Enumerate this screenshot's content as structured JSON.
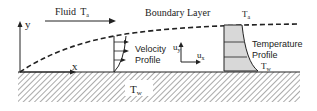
{
  "title": "Boundary Layer",
  "fluid_label": "Fluid",
  "free_stream_temp": {
    "symbol": "T",
    "subscript": "a"
  },
  "wall_temp": {
    "symbol": "T",
    "subscript": "w"
  },
  "axes": {
    "x": "x",
    "y": "y"
  },
  "velocity_components": {
    "ux": {
      "symbol": "u",
      "subscript": "x"
    },
    "uy": {
      "symbol": "u",
      "subscript": "y"
    }
  },
  "velocity_profile_label": [
    "Velocity",
    "Profile"
  ],
  "temperature_profile_label": [
    "Temperature",
    "Profile"
  ],
  "colors": {
    "ink": "#222222",
    "shade": "#d8d8d8"
  }
}
